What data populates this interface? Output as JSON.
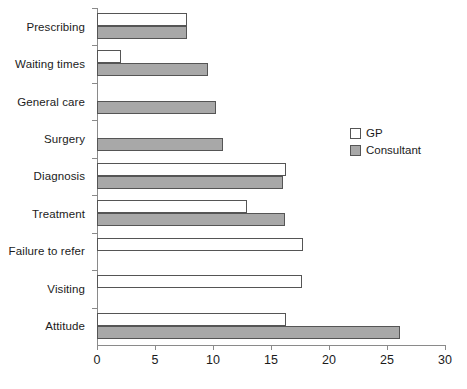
{
  "chart_data": {
    "type": "bar",
    "orientation": "horizontal",
    "title": "",
    "subtitle": "",
    "xlabel": "",
    "ylabel": "",
    "xlim": [
      0,
      30
    ],
    "xticks": [
      0,
      5,
      10,
      15,
      20,
      25,
      30
    ],
    "xtick_labels": [
      "0",
      "5",
      "10",
      "15",
      "20",
      "25",
      "30"
    ],
    "grid": false,
    "legend_position": "right",
    "categories": [
      "Prescribing",
      "Waiting times",
      "General care",
      "Surgery",
      "Diagnosis",
      "Treatment",
      "Failure to refer",
      "Visiting",
      "Attitude"
    ],
    "series": [
      {
        "name": "GP",
        "color": "#ffffff",
        "edge_color": "#555555",
        "values": [
          7.8,
          2.1,
          0,
          0,
          16.3,
          12.9,
          17.8,
          17.7,
          16.3
        ]
      },
      {
        "name": "Consultant",
        "color": "#a8a8a8",
        "edge_color": "#555555",
        "values": [
          7.8,
          9.6,
          10.3,
          10.9,
          16.0,
          16.2,
          0,
          0,
          26.1
        ]
      }
    ]
  },
  "legend": {
    "items": [
      {
        "label": "GP",
        "swatch": "gp-swatch"
      },
      {
        "label": "Consultant",
        "swatch": "consultant-swatch"
      }
    ]
  },
  "colors": {
    "axis": "#8a8a8a",
    "bar_edge": "#555555",
    "gp_fill": "#ffffff",
    "consultant_fill": "#a8a8a8",
    "text": "#1b1b1b",
    "background": "#ffffff"
  }
}
